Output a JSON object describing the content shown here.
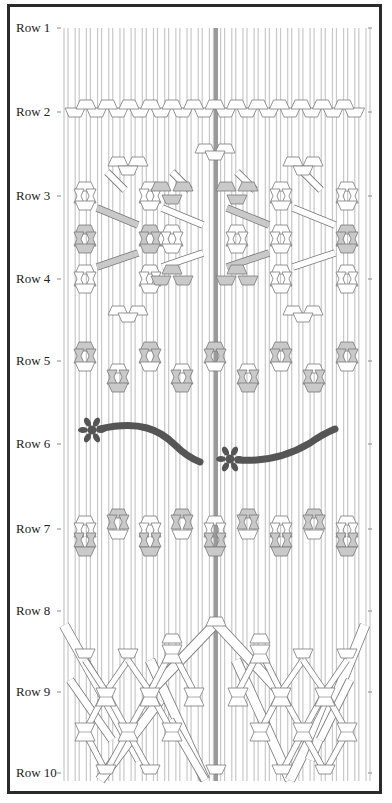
{
  "diagram": {
    "type": "macrame-pattern-chart",
    "row_labels": [
      {
        "label": "Row 1",
        "y": 28
      },
      {
        "label": "Row 2",
        "y": 112
      },
      {
        "label": "Row 3",
        "y": 196
      },
      {
        "label": "Row 4",
        "y": 279
      },
      {
        "label": "Row 5",
        "y": 361
      },
      {
        "label": "Row 6",
        "y": 444
      },
      {
        "label": "Row 7",
        "y": 529
      },
      {
        "label": "Row 8",
        "y": 611
      },
      {
        "label": "Row 9",
        "y": 692
      },
      {
        "label": "Row 10",
        "y": 773
      }
    ],
    "colors": {
      "frame": "#2a2a2a",
      "strand": "#c8c8c8",
      "center_strand": "#9a9a9a",
      "knot_fill": "#ffffff",
      "knot_shaded": "#c9c9c9",
      "knot_stroke": "#7a7a7a",
      "flower_vine": "#555555"
    },
    "strands": {
      "x_start": 64,
      "x_end": 366,
      "count": 28,
      "top": 16,
      "bottom": 785,
      "center_x": 216
    },
    "tick_x_left": 60,
    "tick_x_right": 372
  }
}
